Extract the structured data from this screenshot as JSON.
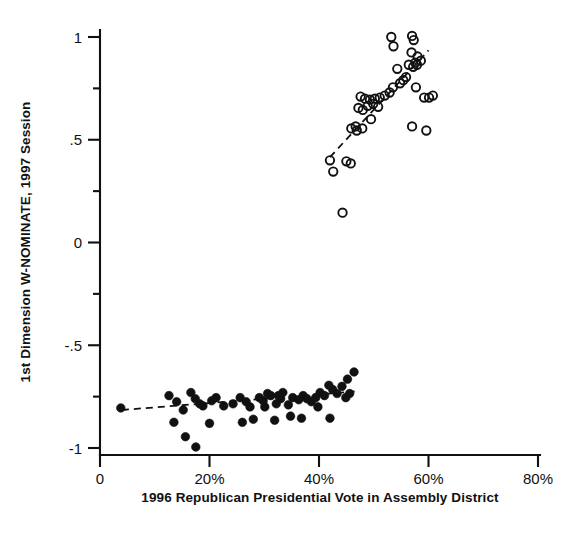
{
  "chart_data": {
    "type": "scatter",
    "title": "",
    "xlabel": "1996 Republican Presidential Vote in Assembly District",
    "ylabel": "1st Dimension W-NOMINATE, 1997 Session",
    "xlim": [
      0,
      80
    ],
    "ylim": [
      -1,
      1
    ],
    "grid": false,
    "legend": "none",
    "xticks": [
      {
        "value": 0,
        "label": "0"
      },
      {
        "value": 20,
        "label": "20%"
      },
      {
        "value": 40,
        "label": "40%"
      },
      {
        "value": 60,
        "label": "60%"
      },
      {
        "value": 80,
        "label": "80%"
      }
    ],
    "yticks": [
      {
        "value": 1,
        "label": "1"
      },
      {
        "value": 0.5,
        "label": ".5"
      },
      {
        "value": 0,
        "label": "0"
      },
      {
        "value": -0.5,
        "label": "-.5"
      },
      {
        "value": -1,
        "label": "-1"
      }
    ],
    "series": [
      {
        "name": "Republicans",
        "marker": "open-circle",
        "marker_size": 8.4,
        "color": "#111111",
        "points": [
          [
            53.2,
            1.0
          ],
          [
            53.6,
            0.955
          ],
          [
            57.0,
            1.005
          ],
          [
            57.3,
            0.985
          ],
          [
            56.9,
            0.925
          ],
          [
            58.0,
            0.905
          ],
          [
            57.6,
            0.875
          ],
          [
            57.9,
            0.865
          ],
          [
            58.6,
            0.885
          ],
          [
            56.4,
            0.865
          ],
          [
            57.2,
            0.855
          ],
          [
            54.3,
            0.845
          ],
          [
            55.9,
            0.805
          ],
          [
            55.4,
            0.79
          ],
          [
            54.8,
            0.775
          ],
          [
            53.5,
            0.755
          ],
          [
            57.7,
            0.755
          ],
          [
            52.9,
            0.73
          ],
          [
            52.0,
            0.715
          ],
          [
            51.1,
            0.705
          ],
          [
            50.2,
            0.7
          ],
          [
            49.3,
            0.695
          ],
          [
            48.4,
            0.7
          ],
          [
            47.6,
            0.71
          ],
          [
            49.9,
            0.675
          ],
          [
            48.9,
            0.665
          ],
          [
            50.8,
            0.66
          ],
          [
            47.2,
            0.655
          ],
          [
            48.0,
            0.645
          ],
          [
            59.2,
            0.705
          ],
          [
            60.1,
            0.705
          ],
          [
            60.8,
            0.715
          ],
          [
            49.5,
            0.6
          ],
          [
            46.7,
            0.565
          ],
          [
            47.9,
            0.555
          ],
          [
            45.9,
            0.555
          ],
          [
            46.9,
            0.545
          ],
          [
            57.0,
            0.565
          ],
          [
            59.6,
            0.545
          ],
          [
            42.0,
            0.4
          ],
          [
            42.6,
            0.345
          ],
          [
            45.0,
            0.395
          ],
          [
            45.8,
            0.385
          ],
          [
            44.3,
            0.145
          ]
        ]
      },
      {
        "name": "Democrats",
        "marker": "filled-circle",
        "marker_size": 8.6,
        "color": "#111111",
        "points": [
          [
            3.8,
            -0.805
          ],
          [
            12.6,
            -0.745
          ],
          [
            14.0,
            -0.775
          ],
          [
            15.2,
            -0.815
          ],
          [
            16.6,
            -0.73
          ],
          [
            17.4,
            -0.76
          ],
          [
            18.8,
            -0.795
          ],
          [
            18.2,
            -0.785
          ],
          [
            13.5,
            -0.875
          ],
          [
            15.6,
            -0.945
          ],
          [
            17.5,
            -0.995
          ],
          [
            20.4,
            -0.77
          ],
          [
            21.2,
            -0.755
          ],
          [
            22.6,
            -0.795
          ],
          [
            20.0,
            -0.88
          ],
          [
            24.3,
            -0.785
          ],
          [
            25.6,
            -0.755
          ],
          [
            26.7,
            -0.775
          ],
          [
            27.4,
            -0.8
          ],
          [
            28.0,
            -0.86
          ],
          [
            26.0,
            -0.875
          ],
          [
            29.1,
            -0.755
          ],
          [
            29.8,
            -0.77
          ],
          [
            30.6,
            -0.735
          ],
          [
            31.2,
            -0.745
          ],
          [
            30.1,
            -0.8
          ],
          [
            31.9,
            -0.865
          ],
          [
            32.6,
            -0.745
          ],
          [
            33.4,
            -0.73
          ],
          [
            33.0,
            -0.76
          ],
          [
            32.2,
            -0.785
          ],
          [
            34.4,
            -0.79
          ],
          [
            35.2,
            -0.755
          ],
          [
            34.8,
            -0.845
          ],
          [
            36.3,
            -0.765
          ],
          [
            37.1,
            -0.745
          ],
          [
            37.8,
            -0.76
          ],
          [
            36.8,
            -0.855
          ],
          [
            38.6,
            -0.775
          ],
          [
            39.4,
            -0.755
          ],
          [
            40.2,
            -0.73
          ],
          [
            39.8,
            -0.8
          ],
          [
            41.0,
            -0.745
          ],
          [
            41.8,
            -0.695
          ],
          [
            42.5,
            -0.715
          ],
          [
            43.3,
            -0.735
          ],
          [
            42.0,
            -0.855
          ],
          [
            44.2,
            -0.7
          ],
          [
            44.9,
            -0.755
          ],
          [
            45.6,
            -0.735
          ],
          [
            46.4,
            -0.63
          ],
          [
            45.2,
            -0.665
          ]
        ]
      }
    ],
    "fit_lines": [
      {
        "name": "republican-fit",
        "style": "dashed",
        "x0": 42.0,
        "y0": 0.415,
        "x1": 60.0,
        "y1": 0.935
      },
      {
        "name": "democrat-fit",
        "style": "dashed",
        "x0": 4.0,
        "y0": -0.815,
        "x1": 46.5,
        "y1": -0.725
      }
    ]
  },
  "axes": {
    "x_title": "1996 Republican Presidential Vote in Assembly District",
    "y_title": "1st Dimension W-NOMINATE, 1997 Session"
  }
}
